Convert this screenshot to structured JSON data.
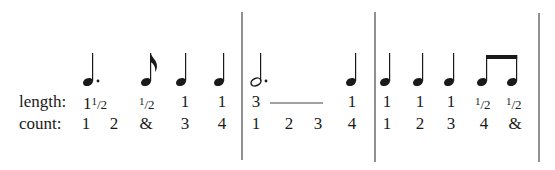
{
  "row_labels": {
    "length": "length:",
    "count": "count:"
  },
  "measures": [
    {
      "notes": [
        {
          "type": "dotted-quarter",
          "x": 88,
          "length": "1½",
          "length_whole": "1",
          "length_frac": "1/2"
        },
        {
          "type": "eighth",
          "x": 150,
          "length": "½",
          "length_frac": "1/2"
        },
        {
          "type": "quarter",
          "x": 184,
          "length": "1"
        },
        {
          "type": "quarter",
          "x": 222,
          "length": "1"
        }
      ],
      "counts": [
        {
          "x": 88,
          "text": "1"
        },
        {
          "x": 114,
          "text": "2"
        },
        {
          "x": 147,
          "text": "&"
        },
        {
          "x": 185,
          "text": "3"
        },
        {
          "x": 222,
          "text": "4"
        }
      ]
    },
    {
      "notes": [
        {
          "type": "dotted-half",
          "x": 258,
          "length": "3"
        },
        {
          "type": "quarter",
          "x": 354,
          "length": "1"
        }
      ],
      "counts": [
        {
          "x": 256,
          "text": "1"
        },
        {
          "x": 289,
          "text": "2"
        },
        {
          "x": 318,
          "text": "3"
        },
        {
          "x": 352,
          "text": "4"
        }
      ],
      "tie_line": {
        "x1": 270,
        "x2": 322
      }
    },
    {
      "notes": [
        {
          "type": "quarter",
          "x": 387,
          "length": "1"
        },
        {
          "type": "quarter",
          "x": 420,
          "length": "1"
        },
        {
          "type": "quarter",
          "x": 451,
          "length": "1"
        },
        {
          "type": "beamed-eighth",
          "x": 485,
          "length": "½",
          "length_frac": "1/2"
        },
        {
          "type": "beamed-eighth",
          "x": 515,
          "length": "½",
          "length_frac": "1/2"
        }
      ],
      "counts": [
        {
          "x": 387,
          "text": "1"
        },
        {
          "x": 420,
          "text": "2"
        },
        {
          "x": 451,
          "text": "3"
        },
        {
          "x": 484,
          "text": "4"
        },
        {
          "x": 515,
          "text": "&"
        }
      ]
    }
  ],
  "length_texts": {
    "m1_n1": "1",
    "m1_n1_frac_num": "1",
    "m1_n1_frac_den": "/2",
    "m1_n2_frac_num": "1",
    "m1_n2_frac_den": "/2",
    "m1_n3": "1",
    "m1_n4": "1",
    "m2_n1": "3",
    "m2_n2": "1",
    "m3_n1": "1",
    "m3_n2": "1",
    "m3_n3": "1",
    "m3_n4_frac_num": "1",
    "m3_n4_frac_den": "/2",
    "m3_n5_frac_num": "1",
    "m3_n5_frac_den": "/2"
  },
  "count_texts": {
    "m1": [
      "1",
      "2",
      "&",
      "3",
      "4"
    ],
    "m2": [
      "1",
      "2",
      "3",
      "4"
    ],
    "m3": [
      "1",
      "2",
      "3",
      "4",
      "&"
    ]
  },
  "barlines_x": [
    242,
    375,
    539
  ],
  "colors": {
    "ink": "#1a1a1a",
    "barline": "#555555",
    "background": "#ffffff"
  }
}
